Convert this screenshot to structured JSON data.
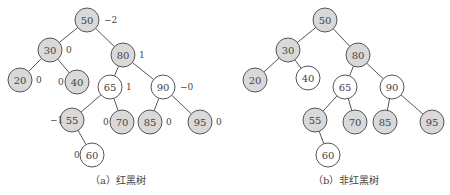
{
  "trees": [
    {
      "id": "a",
      "caption": "（a）红黑树",
      "caption_pos": [
        90,
        180
      ],
      "nodes": [
        {
          "key": "50",
          "x": 87,
          "y": 20,
          "fill": "gray",
          "label": "−2",
          "lx": 104,
          "ly": 23
        },
        {
          "key": "30",
          "x": 50,
          "y": 50,
          "fill": "gray",
          "label": "0",
          "lx": 66,
          "ly": 53
        },
        {
          "key": "80",
          "x": 123,
          "y": 55,
          "fill": "gray",
          "label": "1",
          "lx": 139,
          "ly": 58
        },
        {
          "key": "20",
          "x": 20,
          "y": 80,
          "fill": "gray",
          "label": "0",
          "lx": 36,
          "ly": 83
        },
        {
          "key": "40",
          "x": 77,
          "y": 82,
          "fill": "gray",
          "label": "0",
          "lx": 58,
          "ly": 85
        },
        {
          "key": "65",
          "x": 110,
          "y": 87,
          "fill": "white",
          "label": "1",
          "lx": 126,
          "ly": 90
        },
        {
          "key": "90",
          "x": 163,
          "y": 87,
          "fill": "white",
          "label": "−0",
          "lx": 180,
          "ly": 90
        },
        {
          "key": "55",
          "x": 72,
          "y": 120,
          "fill": "gray",
          "label": "−1",
          "lx": 50,
          "ly": 123
        },
        {
          "key": "70",
          "x": 122,
          "y": 122,
          "fill": "gray",
          "label": "0",
          "lx": 103,
          "ly": 125
        },
        {
          "key": "85",
          "x": 150,
          "y": 122,
          "fill": "gray",
          "label": "0",
          "lx": 166,
          "ly": 125
        },
        {
          "key": "95",
          "x": 200,
          "y": 122,
          "fill": "gray",
          "label": "0",
          "lx": 216,
          "ly": 125
        },
        {
          "key": "60",
          "x": 92,
          "y": 155,
          "fill": "white",
          "label": "0",
          "lx": 74,
          "ly": 158
        }
      ],
      "edges": [
        [
          "50",
          "30"
        ],
        [
          "50",
          "80"
        ],
        [
          "30",
          "20"
        ],
        [
          "30",
          "40"
        ],
        [
          "80",
          "65"
        ],
        [
          "80",
          "90"
        ],
        [
          "65",
          "55"
        ],
        [
          "65",
          "70"
        ],
        [
          "90",
          "85"
        ],
        [
          "90",
          "95"
        ],
        [
          "55",
          "60"
        ]
      ]
    },
    {
      "id": "b",
      "caption": "（b）非红黑树",
      "caption_pos": [
        318,
        180
      ],
      "nodes": [
        {
          "key": "50",
          "x": 325,
          "y": 20,
          "fill": "gray"
        },
        {
          "key": "30",
          "x": 288,
          "y": 50,
          "fill": "gray"
        },
        {
          "key": "80",
          "x": 358,
          "y": 55,
          "fill": "gray"
        },
        {
          "key": "20",
          "x": 255,
          "y": 80,
          "fill": "gray"
        },
        {
          "key": "40",
          "x": 308,
          "y": 78,
          "fill": "white"
        },
        {
          "key": "65",
          "x": 345,
          "y": 87,
          "fill": "white"
        },
        {
          "key": "90",
          "x": 392,
          "y": 87,
          "fill": "white"
        },
        {
          "key": "55",
          "x": 315,
          "y": 120,
          "fill": "gray"
        },
        {
          "key": "70",
          "x": 355,
          "y": 122,
          "fill": "gray"
        },
        {
          "key": "85",
          "x": 385,
          "y": 122,
          "fill": "gray"
        },
        {
          "key": "95",
          "x": 432,
          "y": 122,
          "fill": "gray"
        },
        {
          "key": "60",
          "x": 328,
          "y": 155,
          "fill": "white"
        }
      ],
      "edges": [
        [
          "50",
          "30"
        ],
        [
          "50",
          "80"
        ],
        [
          "30",
          "20"
        ],
        [
          "30",
          "40"
        ],
        [
          "80",
          "65"
        ],
        [
          "80",
          "90"
        ],
        [
          "65",
          "55"
        ],
        [
          "65",
          "70"
        ],
        [
          "90",
          "85"
        ],
        [
          "90",
          "95"
        ],
        [
          "55",
          "60"
        ]
      ]
    }
  ],
  "colors": {
    "gray": "#d9d9d9",
    "white": "#ffffff",
    "stroke": "#555555",
    "text": "#444444"
  }
}
